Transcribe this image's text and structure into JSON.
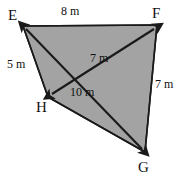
{
  "figure": {
    "kind": "geometry-diagram",
    "shape_name": "quadrilateral EFGH",
    "background_color": "#ffffff",
    "fill_color": "#a3a3a3",
    "stroke_color": "#1a1a1a",
    "vertices": [
      {
        "name": "E",
        "label": "E",
        "x": 23,
        "y": 26,
        "label_x": 8,
        "label_y": 8
      },
      {
        "name": "F",
        "label": "F",
        "x": 157,
        "y": 25,
        "label_x": 152,
        "label_y": 6
      },
      {
        "name": "G",
        "label": "G",
        "x": 145,
        "y": 152,
        "label_x": 138,
        "label_y": 160
      },
      {
        "name": "H",
        "label": "H",
        "x": 48,
        "y": 97,
        "label_x": 36,
        "label_y": 100
      }
    ],
    "edges": [
      {
        "name": "edge-EF",
        "from": "E",
        "to": "F"
      },
      {
        "name": "edge-FG",
        "from": "F",
        "to": "G"
      },
      {
        "name": "edge-GH",
        "from": "G",
        "to": "H"
      },
      {
        "name": "edge-HE",
        "from": "H",
        "to": "E"
      }
    ],
    "diagonals": [
      {
        "name": "diagonal-EG",
        "from": "E",
        "to": "G",
        "arrows": "both",
        "length_label": "10 m"
      },
      {
        "name": "diagonal-FH",
        "from": "F",
        "to": "H",
        "arrows": "both",
        "length_label": "7 m"
      }
    ],
    "measurements": [
      {
        "name": "length-EF",
        "value": "8",
        "unit": "m",
        "text": "8 m",
        "x": 61,
        "y": 5
      },
      {
        "name": "length-EH",
        "value": "5",
        "unit": "m",
        "text": "5 m",
        "x": 7,
        "y": 58
      },
      {
        "name": "length-FH",
        "value": "7",
        "unit": "m",
        "text": "7 m",
        "x": 90,
        "y": 52
      },
      {
        "name": "length-FG",
        "value": "7",
        "unit": "m",
        "text": "7 m",
        "x": 155,
        "y": 78
      },
      {
        "name": "length-EG",
        "value": "10",
        "unit": "m",
        "text": "10 m",
        "x": 70,
        "y": 86
      }
    ]
  }
}
